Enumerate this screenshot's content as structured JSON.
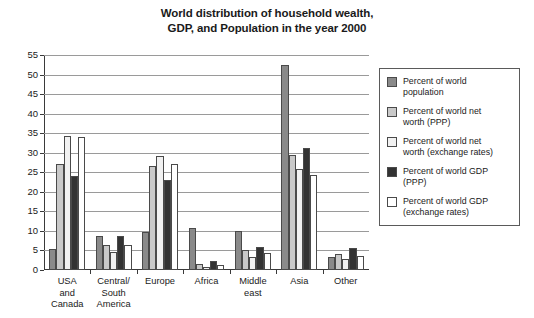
{
  "chart_data": {
    "type": "bar",
    "title": "World distribution of household wealth, GDP, and Population in the year 2000",
    "title_lines": [
      "World distribution of household wealth,",
      "GDP, and Population in the year 2000"
    ],
    "xlabel": "",
    "ylabel": "",
    "ylim": [
      0,
      55
    ],
    "yticks": [
      0,
      5,
      10,
      15,
      20,
      25,
      30,
      35,
      40,
      45,
      50,
      55
    ],
    "grid": true,
    "legend_position": "right",
    "categories": [
      "USA and Canada",
      "Central/ South America",
      "Europe",
      "Africa",
      "Middle east",
      "Asia",
      "Other"
    ],
    "category_lines": [
      [
        "USA",
        "and",
        "Canada"
      ],
      [
        "Central/",
        "South",
        "America"
      ],
      [
        "Europe"
      ],
      [
        "Africa"
      ],
      [
        "Middle",
        "east"
      ],
      [
        "Asia"
      ],
      [
        "Other"
      ]
    ],
    "series": [
      {
        "name": "Percent of world population",
        "label_lines": [
          "Percent of world",
          "population"
        ],
        "color": "#8a8a8a",
        "values": [
          5.3,
          8.6,
          9.6,
          10.7,
          10.0,
          52.5,
          3.3
        ]
      },
      {
        "name": "Percent of world net worth (PPP)",
        "label_lines": [
          "Percent of world net",
          "worth (PPP)"
        ],
        "color": "#c9c9c9",
        "values": [
          27.0,
          6.5,
          26.5,
          1.6,
          5.1,
          29.5,
          4.1
        ]
      },
      {
        "name": "Percent of world net worth (exchange rates)",
        "label_lines": [
          "Percent of world net",
          "worth (exchange rates)"
        ],
        "color": "#f1f1f1",
        "values": [
          34.4,
          4.5,
          29.2,
          0.7,
          3.3,
          25.8,
          2.7
        ]
      },
      {
        "name": "Percent of world GDP (PPP)",
        "label_lines": [
          "Percent of world GDP",
          "(PPP)"
        ],
        "color": "#333333",
        "values": [
          24.1,
          8.6,
          23.0,
          2.3,
          5.8,
          31.2,
          5.6
        ]
      },
      {
        "name": "Percent of world GDP (exchange rates)",
        "label_lines": [
          "Percent of world GDP",
          "(exchange rates)"
        ],
        "color": "#ffffff",
        "values": [
          33.9,
          6.5,
          27.2,
          1.2,
          4.4,
          24.4,
          3.5
        ]
      }
    ]
  }
}
